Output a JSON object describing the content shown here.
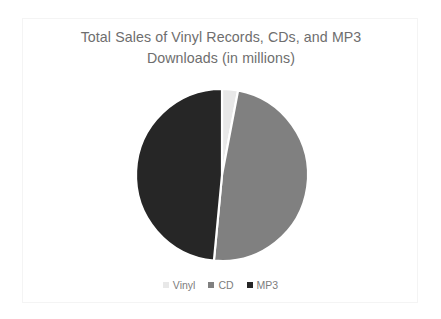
{
  "slide": {
    "background_color": "#ffffff",
    "frame_color": "#f4f4f4"
  },
  "chart_data": {
    "type": "pie",
    "title": "Total Sales of Vinyl Records, CDs, and MP3 Downloads (in millions)",
    "title_line1": "Total Sales of Vinyl Records, CDs, and MP3",
    "title_line2": "Downloads (in millions)",
    "title_color": "#6e6e6e",
    "xlabel": "",
    "ylabel": "",
    "grid": false,
    "legend_position": "bottom",
    "start_angle_deg": 0,
    "direction": "clockwise",
    "categories": [
      "Vinyl",
      "CD",
      "MP3"
    ],
    "values": [
      3,
      48.5,
      48.5
    ],
    "percentages": [
      "3%",
      "48.5%",
      "48.5%"
    ],
    "angles_deg": [
      10.8,
      174.6,
      174.6
    ],
    "colors": [
      "#e8e8e8",
      "#808080",
      "#262626"
    ],
    "slice_border_color": "#ffffff",
    "slices": [
      {
        "label": "Vinyl",
        "value": 3,
        "percent": "3%",
        "angle_deg": 10.8,
        "color": "#e8e8e8"
      },
      {
        "label": "CD",
        "value": 48.5,
        "percent": "48.5%",
        "angle_deg": 174.6,
        "color": "#808080"
      },
      {
        "label": "MP3",
        "value": 48.5,
        "percent": "48.5%",
        "angle_deg": 174.6,
        "color": "#262626"
      }
    ],
    "legend": [
      {
        "label": "Vinyl",
        "color": "#e8e8e8"
      },
      {
        "label": "CD",
        "color": "#808080"
      },
      {
        "label": "MP3",
        "color": "#262626"
      }
    ]
  }
}
